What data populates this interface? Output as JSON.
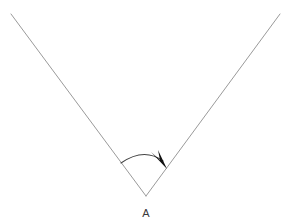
{
  "canvas": {
    "width": 286,
    "height": 221,
    "background_color": "#ffffff"
  },
  "figure": {
    "title": "",
    "type": "geometry-angle-diagram"
  },
  "labels": {
    "vertex_label": "A"
  },
  "colors": {
    "ray_stroke": "#9a9a9a",
    "arc_stroke": "#444444",
    "arrow_fill": "#111111",
    "label_text": "#3a3a3a",
    "background": "#ffffff"
  },
  "geometry": {
    "vertex": {
      "x": 146,
      "y": 196
    },
    "left_ray_end": {
      "x": 11,
      "y": 14
    },
    "right_ray_end": {
      "x": 280,
      "y": 14
    },
    "left_ray_path": "M 11 14 L 146 196",
    "right_ray_path": "M 146 196 L 280 14",
    "arc_path": "M 121 163 Q 144 147 163 161",
    "arrow_head_path": "M 167 169 L 151 152 L 160 160 L 158 150 Z",
    "vertex_label_position": {
      "x": 146,
      "y": 217
    },
    "arc_start": {
      "x": 121,
      "y": 163
    },
    "arc_end": {
      "x": 163,
      "y": 161
    },
    "arrow_tip": {
      "x": 167,
      "y": 169
    }
  }
}
